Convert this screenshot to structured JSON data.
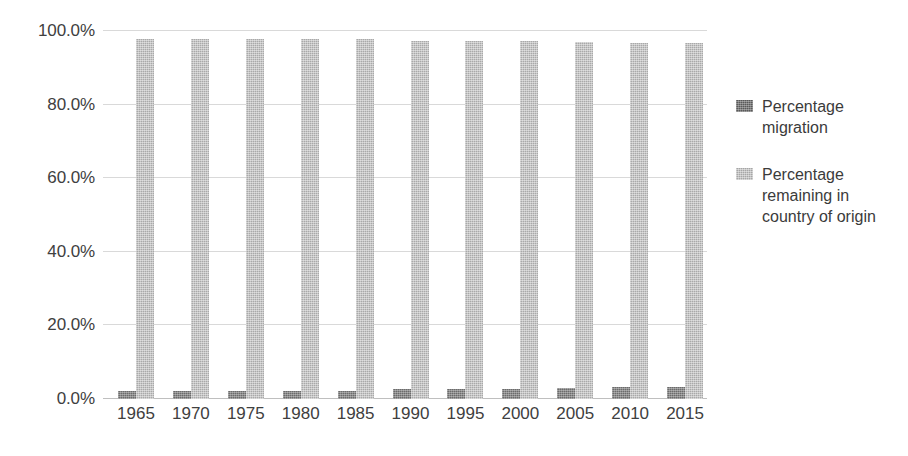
{
  "chart_data": {
    "type": "bar",
    "title": "",
    "subtitle": "",
    "xlabel": "",
    "ylabel": "",
    "categories": [
      "1965",
      "1970",
      "1975",
      "1980",
      "1985",
      "1990",
      "1995",
      "2000",
      "2005",
      "2010",
      "2015"
    ],
    "series": [
      {
        "name": "Percentage migration",
        "color": "#595959",
        "values": [
          2.3,
          2.3,
          2.3,
          2.3,
          2.3,
          2.7,
          2.7,
          2.8,
          2.9,
          3.2,
          3.3
        ]
      },
      {
        "name": "Percentage remaining in country of origin",
        "color": "#a6a6a6",
        "values": [
          97.7,
          97.7,
          97.7,
          97.7,
          97.7,
          97.3,
          97.3,
          97.2,
          97.1,
          96.8,
          96.7
        ]
      }
    ],
    "ylim": [
      0,
      100
    ],
    "yticks": [
      0,
      20,
      40,
      60,
      80,
      100
    ],
    "ytick_labels": [
      "0.0%",
      "20.0%",
      "40.0%",
      "60.0%",
      "80.0%",
      "100.0%"
    ],
    "grid": true,
    "grid_axis": "y",
    "legend_position": "right",
    "value_suffix": "%"
  },
  "legend": {
    "items": [
      {
        "label": "Percentage migration",
        "swatch": "legend-swatch-migration"
      },
      {
        "label": "Percentage remaining in country of origin",
        "swatch": "legend-swatch-remaining"
      }
    ]
  }
}
